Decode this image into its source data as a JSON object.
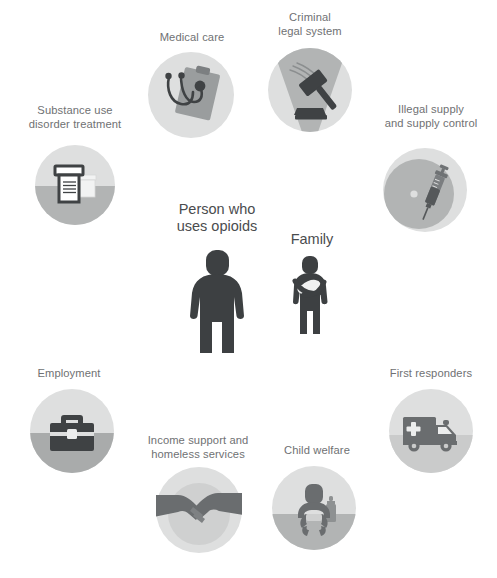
{
  "diagram": {
    "background_color": "#ffffff",
    "palette": {
      "circle_light": "#dedfdf",
      "circle_mid": "#b9bbbb",
      "circle_dark": "#a9abab",
      "icon_dark": "#3f4244",
      "icon_mid": "#6f7274",
      "icon_light": "#e8e9e9",
      "label_gray": "#6f7173",
      "center_label_gray": "#4a4c4e",
      "figure_dark": "#3d4042"
    },
    "center_nodes": [
      {
        "id": "person-who-uses-opioids",
        "label": "Person who\nuses opioids",
        "icon": "adult-person-figure"
      },
      {
        "id": "family",
        "label": "Family",
        "icon": "parent-holding-baby-figure"
      }
    ],
    "surrounding_nodes": [
      {
        "id": "substance-use-disorder-treatment",
        "label": "Substance use\ndisorder treatment",
        "icon": "pill-bottle-icon",
        "circle_style": "split-horizontal"
      },
      {
        "id": "medical-care",
        "label": "Medical care",
        "icon": "stethoscope-clipboard-icon",
        "circle_style": "plain"
      },
      {
        "id": "criminal-legal-system",
        "label": "Criminal\nlegal system",
        "icon": "gavel-icon",
        "circle_style": "inverted-triangle"
      },
      {
        "id": "illegal-supply-and-supply-control",
        "label": "Illegal supply\nand supply control",
        "icon": "syringe-icon",
        "circle_style": "offset-circle"
      },
      {
        "id": "employment",
        "label": "Employment",
        "icon": "briefcase-icon",
        "circle_style": "split-horizontal"
      },
      {
        "id": "income-support-and-homeless-services",
        "label": "Income support and\nhomeless services",
        "icon": "handshake-icon",
        "circle_style": "inner-circle"
      },
      {
        "id": "child-welfare",
        "label": "Child welfare",
        "icon": "baby-bottle-icon",
        "circle_style": "split-horizontal"
      },
      {
        "id": "first-responders",
        "label": "First responders",
        "icon": "ambulance-icon",
        "circle_style": "split-horizontal"
      }
    ]
  }
}
